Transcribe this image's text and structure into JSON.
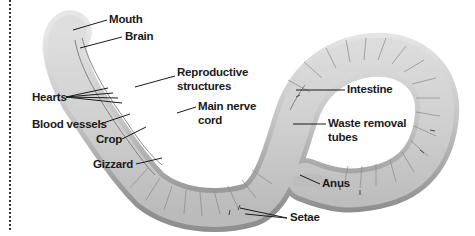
{
  "diagram": {
    "colors": {
      "worm_body": "#cfcfcf",
      "worm_shade": "#9a9a9a",
      "leader": "#1a1a1a",
      "text": "#1a1a1a"
    },
    "labels": {
      "mouth": "Mouth",
      "brain": "Brain",
      "reproductive_1": "Reproductive",
      "reproductive_2": "structures",
      "hearts": "Hearts",
      "main_nerve_1": "Main nerve",
      "main_nerve_2": "cord",
      "blood_vessels": "Blood vessels",
      "crop": "Crop",
      "gizzard": "Gizzard",
      "intestine": "Intestine",
      "waste_1": "Waste removal",
      "waste_2": "tubes",
      "anus": "Anus",
      "setae": "Setae"
    }
  }
}
